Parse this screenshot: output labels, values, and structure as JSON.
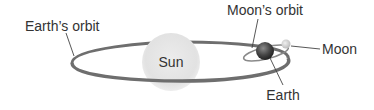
{
  "diagram": {
    "labels": {
      "earth_orbit": "Earth’s orbit",
      "sun": "Sun",
      "moon_orbit": "Moon’s orbit",
      "moon": "Moon",
      "earth": "Earth"
    },
    "colors": {
      "orbit": "#6e6e6e",
      "sun": "#e6e6e6",
      "earth": "#4a4a4a",
      "moon": "#d8d8d8",
      "text": "#333333",
      "leader": "#444444"
    }
  }
}
